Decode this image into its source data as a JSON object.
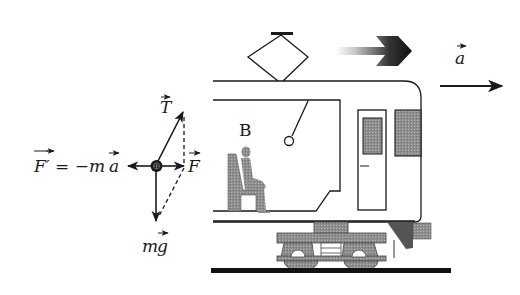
{
  "diagram": {
    "type": "physics-force-diagram",
    "labels": {
      "tension": "T",
      "net_force": "F",
      "inertial_force_lhs": "F′",
      "inertial_force_eq": "= −m",
      "inertial_force_a": "a",
      "gravity_m": "m",
      "gravity_g": "g",
      "acceleration": "a",
      "observer": "B"
    },
    "forces": [
      {
        "name": "T",
        "direction": "up-right",
        "description": "string tension"
      },
      {
        "name": "F",
        "direction": "right",
        "description": "resultant force (dashed parallelogram)"
      },
      {
        "name": "F' = -ma",
        "direction": "left",
        "description": "inertial (fictitious) force"
      },
      {
        "name": "mg",
        "direction": "down",
        "description": "gravity"
      }
    ],
    "motion_indicator": "gradient arrow pointing right",
    "acceleration_direction": "right",
    "colors": {
      "ink": "#1a1a1a",
      "shade": "#8a8a8a",
      "dark_shade": "#555555",
      "background": "#ffffff"
    }
  }
}
